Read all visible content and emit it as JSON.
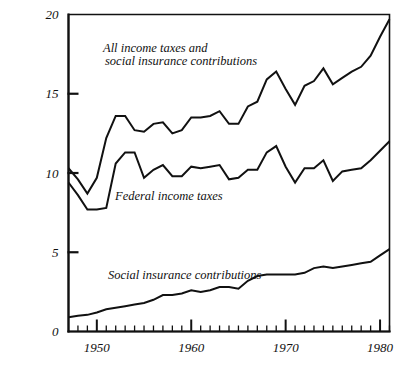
{
  "chart_data": {
    "type": "line",
    "title": "",
    "subtitle": "",
    "xlabel": "",
    "ylabel": "",
    "xlim": [
      1947,
      1981
    ],
    "ylim": [
      0,
      20
    ],
    "grid": false,
    "legend_position": "inline-annotations",
    "y_ticks": [
      0,
      5,
      10,
      15,
      20
    ],
    "y_tick_labels": [
      "0",
      "5",
      "10",
      "15",
      "20"
    ],
    "x_ticks": [
      1948,
      1949,
      1950,
      1951,
      1952,
      1953,
      1954,
      1955,
      1956,
      1957,
      1958,
      1959,
      1960,
      1961,
      1962,
      1963,
      1964,
      1965,
      1966,
      1967,
      1968,
      1969,
      1970,
      1971,
      1972,
      1973,
      1974,
      1975,
      1976,
      1977,
      1978,
      1979,
      1980,
      1981
    ],
    "x_major_ticks": [
      1950,
      1960,
      1970,
      1980
    ],
    "x_tick_labels": [
      "1950",
      "1960",
      "1970",
      "1980"
    ],
    "x": [
      1947,
      1948,
      1949,
      1950,
      1951,
      1952,
      1953,
      1954,
      1955,
      1956,
      1957,
      1958,
      1959,
      1960,
      1961,
      1962,
      1963,
      1964,
      1965,
      1966,
      1967,
      1968,
      1969,
      1970,
      1971,
      1972,
      1973,
      1974,
      1975,
      1976,
      1977,
      1978,
      1979,
      1980,
      1981
    ],
    "series": [
      {
        "name": "All income taxes and social insurance contributions",
        "values": [
          10.3,
          9.6,
          8.7,
          9.7,
          12.2,
          13.6,
          13.6,
          12.7,
          12.6,
          13.1,
          13.2,
          12.5,
          12.7,
          13.5,
          13.5,
          13.6,
          13.9,
          13.1,
          13.1,
          14.2,
          14.5,
          15.9,
          16.4,
          15.3,
          14.3,
          15.5,
          15.8,
          16.6,
          15.6,
          16.0,
          16.4,
          16.7,
          17.4,
          18.6,
          19.7
        ]
      },
      {
        "name": "Federal income taxes",
        "values": [
          9.4,
          8.6,
          7.7,
          7.7,
          7.8,
          10.6,
          11.3,
          11.3,
          9.7,
          10.2,
          10.5,
          9.8,
          9.8,
          10.4,
          10.3,
          10.4,
          10.5,
          9.6,
          9.7,
          10.2,
          10.2,
          11.3,
          11.7,
          10.4,
          9.4,
          10.3,
          10.3,
          10.8,
          9.5,
          10.1,
          10.2,
          10.3,
          10.8,
          11.4,
          12.0
        ]
      },
      {
        "name": "Social insurance contributions",
        "values": [
          0.9,
          1.0,
          1.05,
          1.2,
          1.4,
          1.5,
          1.6,
          1.7,
          1.8,
          2.0,
          2.3,
          2.3,
          2.4,
          2.6,
          2.5,
          2.6,
          2.8,
          2.8,
          2.7,
          3.2,
          3.5,
          3.6,
          3.6,
          3.6,
          3.6,
          3.7,
          4.0,
          4.1,
          4.0,
          4.1,
          4.2,
          4.3,
          4.4,
          4.8,
          5.2
        ]
      }
    ],
    "annotations": [
      {
        "name": "all-income-taxes-label",
        "line1": "All income taxes and",
        "line2": "social insurance contributions",
        "x_px": 103,
        "y_px": 52
      },
      {
        "name": "federal-income-taxes-label",
        "line1": "Federal income taxes",
        "line2": "",
        "x_px": 115,
        "y_px": 200
      },
      {
        "name": "social-insurance-label",
        "line1": "Social insurance contributions",
        "line2": "",
        "x_px": 108,
        "y_px": 279
      }
    ],
    "colors": {
      "line": "#111111",
      "axis": "#111111",
      "background": "#ffffff"
    }
  }
}
